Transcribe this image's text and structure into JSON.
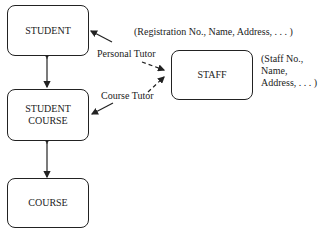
{
  "entities": {
    "student": {
      "label": "STUDENT",
      "attributes": "(Registration No., Name, Address, . . . )"
    },
    "student_course": {
      "line1": "STUDENT",
      "line2": "COURSE"
    },
    "course": {
      "label": "COURSE"
    },
    "staff": {
      "label": "STAFF",
      "attr_line1": "(Staff No.,",
      "attr_line2": "Name,",
      "attr_line3": "Address, . . . )"
    }
  },
  "relationships": {
    "personal_tutor": "Personal Tutor",
    "course_tutor": "Course Tutor"
  }
}
